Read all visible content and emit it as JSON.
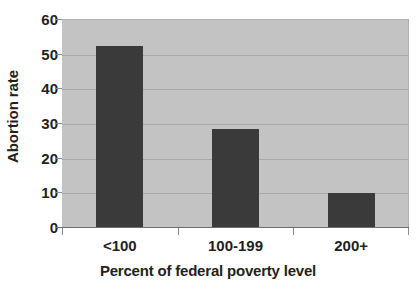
{
  "chart_data": {
    "type": "bar",
    "title": "",
    "subtitle": "",
    "xlabel": "Percent of federal poverty level",
    "ylabel": "Abortion rate",
    "categories": [
      "<100",
      "100-199",
      "200+"
    ],
    "values": [
      52.2,
      28.4,
      9.8
    ],
    "series": [
      {
        "name": "Abortion rate",
        "values": [
          52.2,
          28.4,
          9.8
        ]
      }
    ],
    "ylim": [
      0,
      60
    ],
    "yticks": [
      0,
      10,
      20,
      30,
      40,
      50,
      60
    ],
    "ytick_labels": [
      "0",
      "10",
      "20",
      "30",
      "40",
      "50",
      "60"
    ],
    "grid": true,
    "grid_axis": "y",
    "legend": false,
    "legend_position": "none",
    "annotations": [],
    "colors": {
      "bar": "#3a3a3a",
      "plot_background": "#c3c3c3",
      "figure_background": "#ffffff",
      "gridline": "#a9a9a9",
      "axis_line": "#6e6e6e",
      "text": "#231f20"
    }
  }
}
